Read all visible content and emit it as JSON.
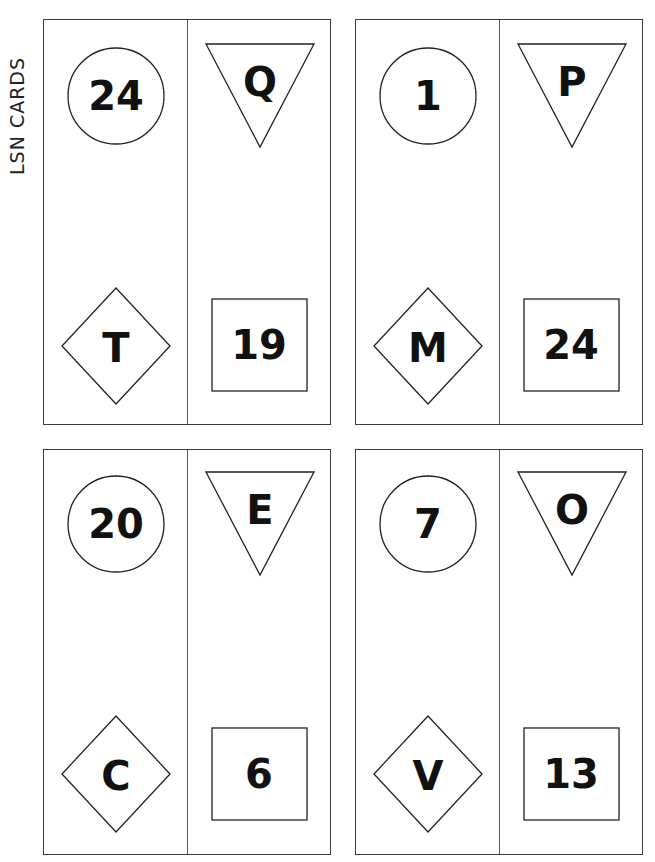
{
  "page": {
    "side_label": "LSN CARDS",
    "colors": {
      "ink": "#111111",
      "border": "#3a3a3a",
      "background": "#ffffff"
    }
  },
  "cards": [
    {
      "position": "top-left",
      "circle": "24",
      "triangle": "Q",
      "diamond": "T",
      "square": "19"
    },
    {
      "position": "top-right",
      "circle": "1",
      "triangle": "P",
      "diamond": "M",
      "square": "24"
    },
    {
      "position": "bottom-left",
      "circle": "20",
      "triangle": "E",
      "diamond": "C",
      "square": "6"
    },
    {
      "position": "bottom-right",
      "circle": "7",
      "triangle": "O",
      "diamond": "V",
      "square": "13"
    }
  ]
}
